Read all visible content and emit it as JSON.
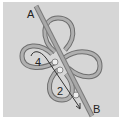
{
  "diagram": {
    "type": "knot-tying-step",
    "labels": {
      "start_end": "A",
      "working_end": "B",
      "loop_left": "4",
      "loop_bottom": "2"
    },
    "markers": [
      {
        "name": "crossing-1",
        "x": 55,
        "y": 62
      },
      {
        "name": "crossing-2",
        "x": 60,
        "y": 70
      },
      {
        "name": "crossing-3",
        "x": 76,
        "y": 95
      }
    ],
    "colors": {
      "background": "#d6d6d6",
      "cord": "#9a9a9a",
      "cord_edge": "#6e6e6e",
      "arrow": "#333333",
      "marker": "#ffffff"
    }
  }
}
